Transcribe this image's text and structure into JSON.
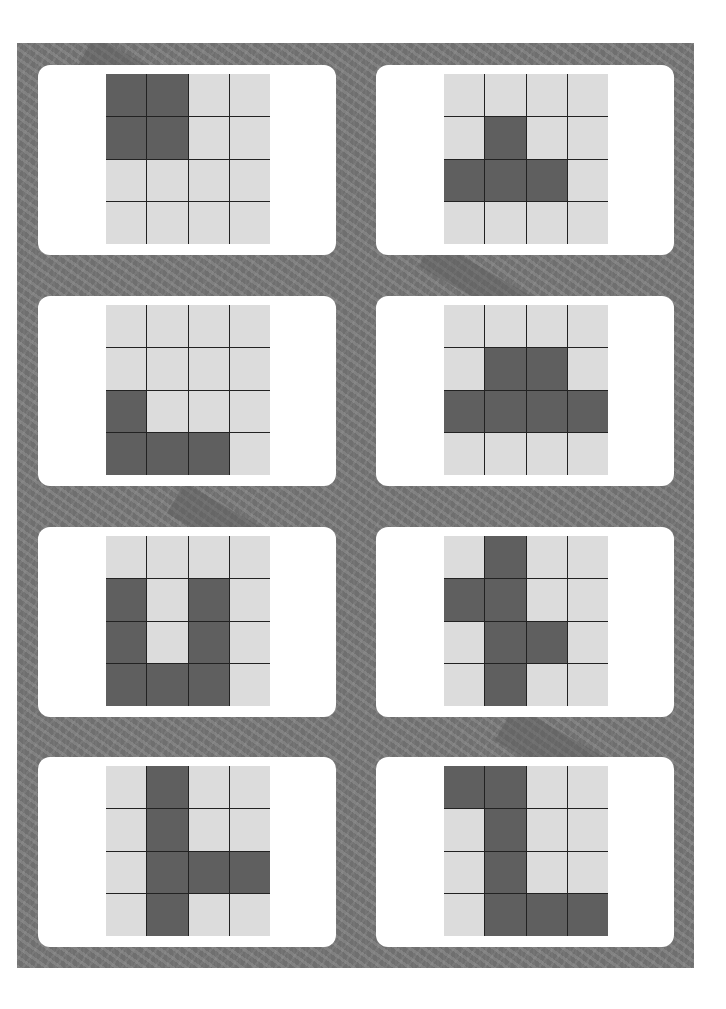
{
  "puzzle": {
    "type": "4x4 grid pattern cards",
    "grid_size": 4,
    "colors": {
      "background_panel": "#6f6f6f",
      "card": "#ffffff",
      "cell_empty": "#dcdcdc",
      "cell_filled": "#5f5f5f",
      "grid_line": "#222222"
    },
    "cards": [
      {
        "id": "card-1",
        "column": "left",
        "row": 1,
        "filled": [
          [
            1,
            1,
            0,
            0
          ],
          [
            1,
            1,
            0,
            0
          ],
          [
            0,
            0,
            0,
            0
          ],
          [
            0,
            0,
            0,
            0
          ]
        ]
      },
      {
        "id": "card-2",
        "column": "right",
        "row": 1,
        "filled": [
          [
            0,
            0,
            0,
            0
          ],
          [
            0,
            1,
            0,
            0
          ],
          [
            1,
            1,
            1,
            0
          ],
          [
            0,
            0,
            0,
            0
          ]
        ]
      },
      {
        "id": "card-3",
        "column": "left",
        "row": 2,
        "filled": [
          [
            0,
            0,
            0,
            0
          ],
          [
            0,
            0,
            0,
            0
          ],
          [
            1,
            0,
            0,
            0
          ],
          [
            1,
            1,
            1,
            0
          ]
        ]
      },
      {
        "id": "card-4",
        "column": "right",
        "row": 2,
        "filled": [
          [
            0,
            0,
            0,
            0
          ],
          [
            0,
            1,
            1,
            0
          ],
          [
            1,
            1,
            1,
            1
          ],
          [
            0,
            0,
            0,
            0
          ]
        ]
      },
      {
        "id": "card-5",
        "column": "left",
        "row": 3,
        "filled": [
          [
            0,
            0,
            0,
            0
          ],
          [
            1,
            0,
            1,
            0
          ],
          [
            1,
            0,
            1,
            0
          ],
          [
            1,
            1,
            1,
            0
          ]
        ]
      },
      {
        "id": "card-6",
        "column": "right",
        "row": 3,
        "filled": [
          [
            0,
            1,
            0,
            0
          ],
          [
            1,
            1,
            0,
            0
          ],
          [
            0,
            1,
            1,
            0
          ],
          [
            0,
            1,
            0,
            0
          ]
        ]
      },
      {
        "id": "card-7",
        "column": "left",
        "row": 4,
        "filled": [
          [
            0,
            1,
            0,
            0
          ],
          [
            0,
            1,
            0,
            0
          ],
          [
            0,
            1,
            1,
            1
          ],
          [
            0,
            1,
            0,
            0
          ]
        ]
      },
      {
        "id": "card-8",
        "column": "right",
        "row": 4,
        "filled": [
          [
            1,
            1,
            0,
            0
          ],
          [
            0,
            1,
            0,
            0
          ],
          [
            0,
            1,
            0,
            0
          ],
          [
            0,
            1,
            1,
            1
          ]
        ]
      }
    ]
  }
}
